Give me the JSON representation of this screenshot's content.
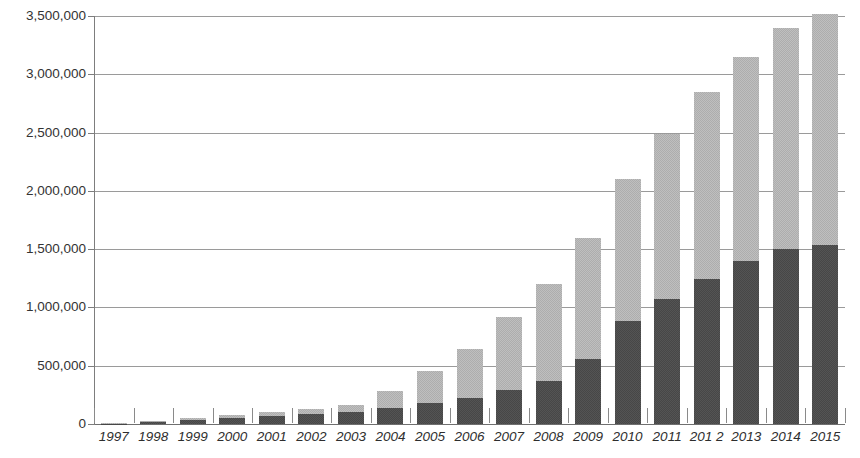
{
  "chart": {
    "title": "",
    "y_axis_tick_labels": [
      "3,500,000",
      "3,000,000",
      "2,500,000",
      "2,000,000",
      "1,500,000",
      "1,000,000",
      "500,000",
      "0"
    ],
    "x_axis_tick_labels": [
      "1997",
      "1998",
      "1999",
      "2000",
      "2001",
      "2002",
      "2003",
      "2004",
      "2005",
      "2006",
      "2007",
      "2008",
      "2009",
      "2010",
      "2011",
      "201 2",
      "2013",
      "2014",
      "2015"
    ],
    "colors": {
      "series_lower": "#474747",
      "series_upper": "#adadad",
      "gridline": "#9a9a9a",
      "axis": "#7d7d7d",
      "background": "#ffffff",
      "text": "#2e2e2e"
    }
  },
  "chart_data": {
    "type": "bar",
    "stacked": true,
    "title": "",
    "subtitle": "",
    "xlabel": "",
    "ylabel": "",
    "ylim": [
      0,
      3500000
    ],
    "ytick_step": 500000,
    "grid": true,
    "legend": "none",
    "orientation": "vertical",
    "categories": [
      "1997",
      "1998",
      "1999",
      "2000",
      "2001",
      "2002",
      "2003",
      "2004",
      "2005",
      "2006",
      "2007",
      "2008",
      "2009",
      "2010",
      "2011",
      "201 2",
      "2013",
      "2014",
      "2015"
    ],
    "series": [
      {
        "name": "lower",
        "color": "#474747",
        "values": [
          3000,
          22000,
          38000,
          55000,
          70000,
          85000,
          105000,
          140000,
          180000,
          225000,
          290000,
          365000,
          560000,
          885000,
          1075000,
          1245000,
          1400000,
          1500000,
          1535000
        ]
      },
      {
        "name": "upper",
        "color": "#adadad",
        "values": [
          2000,
          8000,
          14000,
          25000,
          35000,
          45000,
          55000,
          140000,
          275000,
          415000,
          630000,
          840000,
          1040000,
          1215000,
          1415000,
          1600000,
          1750000,
          1900000,
          1985000
        ]
      }
    ],
    "totals": [
      5000,
      30000,
      52000,
      80000,
      105000,
      130000,
      160000,
      280000,
      455000,
      640000,
      920000,
      1205000,
      1600000,
      2100000,
      2490000,
      2845000,
      3150000,
      3400000,
      3520000
    ]
  }
}
